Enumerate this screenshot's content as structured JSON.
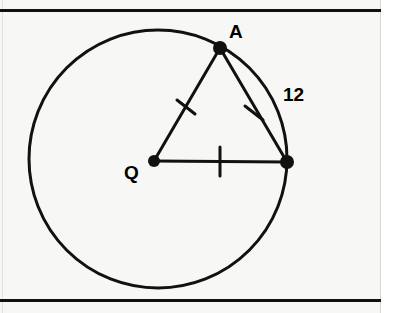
{
  "figure": {
    "background_color": "#f7f7f5",
    "ink_color": "#111111",
    "frame": {
      "top_rule_y": 10,
      "bottom_rule_y": 300,
      "left_x": 2,
      "right_x": 381
    },
    "labels": {
      "center_point": "Q",
      "top_point": "A",
      "chord_length": "12"
    },
    "points": [
      {
        "name": "Q",
        "role": "center",
        "x": 154,
        "y": 161,
        "dot_radius": 6,
        "label": "Q",
        "label_x": 133,
        "label_y": 178
      },
      {
        "name": "A",
        "role": "on-circle",
        "x": 220,
        "y": 48,
        "dot_radius": 7,
        "label": "A",
        "label_x": 238,
        "label_y": 34
      },
      {
        "name": "B",
        "role": "on-circle",
        "x": 287,
        "y": 162,
        "dot_radius": 7,
        "label": "",
        "label_x": 0,
        "label_y": 0
      }
    ],
    "circle": {
      "cx": 158,
      "cy": 159,
      "r": 129,
      "stroke_width": 3
    },
    "segments": [
      {
        "name": "radius-QA",
        "from": "Q",
        "to": "A",
        "x1": 154,
        "y1": 161,
        "x2": 220,
        "y2": 48,
        "stroke_width": 3,
        "tick": "double-slash"
      },
      {
        "name": "chord-AB",
        "from": "A",
        "to": "B",
        "x1": 220,
        "y1": 48,
        "x2": 287,
        "y2": 162,
        "stroke_width": 3,
        "tick": "double-slash",
        "measure_label": "12"
      },
      {
        "name": "radius-QB",
        "from": "Q",
        "to": "B",
        "x1": 154,
        "y1": 161,
        "x2": 287,
        "y2": 162,
        "stroke_width": 3,
        "tick": "single-tick"
      }
    ],
    "tick_marks": [
      {
        "name": "tick-on-QA",
        "cx": 186,
        "cy": 107,
        "style": "x-cross",
        "size": 13
      },
      {
        "name": "tick-on-AB",
        "cx": 254,
        "cy": 113,
        "style": "x-cross",
        "size": 13
      },
      {
        "name": "tick-on-QB",
        "cx": 220,
        "cy": 161,
        "style": "vertical-bar",
        "size": 14
      }
    ],
    "measure_label": {
      "text": "12",
      "x": 294,
      "y": 96,
      "font_size": 19
    },
    "point_label_font_size": 19
  }
}
